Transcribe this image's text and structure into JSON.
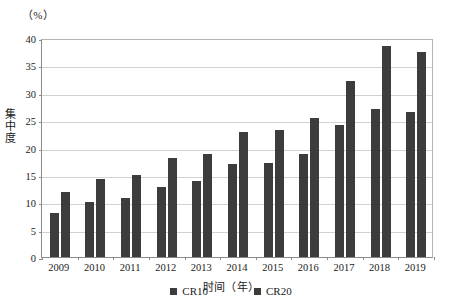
{
  "chart_data": {
    "type": "bar",
    "title": "",
    "unit_label": "（%）",
    "xlabel": "时间（年）",
    "ylabel": "集中度",
    "categories": [
      "2009",
      "2010",
      "2011",
      "2012",
      "2013",
      "2014",
      "2015",
      "2016",
      "2017",
      "2018",
      "2019"
    ],
    "series": [
      {
        "name": "CR10",
        "color": "#3c3c3c",
        "values": [
          8.0,
          10.1,
          10.7,
          12.8,
          13.8,
          17.0,
          17.2,
          18.9,
          24.2,
          27.1,
          26.5
        ]
      },
      {
        "name": "CR20",
        "color": "#3c3c3c",
        "values": [
          11.8,
          14.3,
          15.0,
          18.1,
          18.8,
          22.8,
          23.2,
          25.3,
          32.2,
          38.5,
          37.5
        ]
      }
    ],
    "ylim": [
      0,
      40
    ],
    "yticks": [
      0,
      5,
      10,
      15,
      20,
      25,
      30,
      35,
      40
    ],
    "ytick_labels": [
      "0",
      "5",
      "10",
      "15",
      "20",
      "25",
      "30",
      "35",
      "40"
    ],
    "grid": true,
    "legend_position": "bottom"
  }
}
